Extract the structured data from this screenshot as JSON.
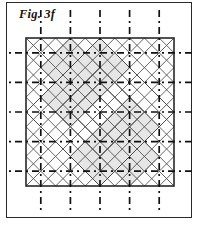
{
  "figure": {
    "caption": "Fig. 3f",
    "panel": {
      "x": 6,
      "y": 2,
      "width": 186,
      "height": 216,
      "border_color": "#2a2a2a",
      "background": "#ffffff"
    },
    "colors": {
      "frame_stroke": "#2a2a2a",
      "square_stroke": "#1a1a1a",
      "diagonal_stroke": "#555555",
      "grid_dash_stroke": "#111111",
      "shade_fill": "#e6e6e6",
      "shade_stroke": "#777777",
      "background": "#ffffff"
    },
    "geometry": {
      "description": "Square boundary with an overlaid 45-degree diamond lattice and a dash-dot square grid extending past the square edges.",
      "square": {
        "x": 19,
        "y": 35,
        "size": 148
      },
      "grid": {
        "divisions": 5,
        "cell_size": 29.6,
        "vertical_line_x": [
          33.8,
          63.4,
          93.0,
          122.6,
          152.2
        ],
        "horizontal_line_y": [
          49.8,
          79.4,
          109.0,
          138.6,
          168.2
        ],
        "overhang": 28,
        "dash_pattern": "7,4,2,4",
        "stroke_width": 1.7
      },
      "diagonals": {
        "step": 29.6,
        "stroke_width": 0.9,
        "note": "Two families of 45-degree lines clipped to the square, forming nested diamonds."
      },
      "shaded_polygons": [
        [
          [
            93,
            35
          ],
          [
            122.6,
            64.6
          ],
          [
            93,
            94.2
          ],
          [
            63.4,
            64.6
          ]
        ],
        [
          [
            63.4,
            64.6
          ],
          [
            93,
            94.2
          ],
          [
            63.4,
            123.8
          ],
          [
            33.8,
            94.2
          ]
        ],
        [
          [
            122.6,
            94.2
          ],
          [
            152.2,
            123.8
          ],
          [
            122.6,
            153.4
          ],
          [
            93,
            123.8
          ]
        ],
        [
          [
            93,
            123.8
          ],
          [
            122.6,
            153.4
          ],
          [
            93,
            183.0
          ],
          [
            63.4,
            153.4
          ]
        ],
        [
          [
            63.4,
            35
          ],
          [
            93,
            64.6
          ],
          [
            63.4,
            94.2
          ],
          [
            33.8,
            64.6
          ]
        ],
        [
          [
            122.6,
            123.8
          ],
          [
            152.2,
            153.4
          ],
          [
            122.6,
            183.0
          ],
          [
            93,
            153.4
          ]
        ]
      ],
      "inner_diamonds": [
        {
          "cx": 93,
          "cy": 109,
          "r": 74
        },
        {
          "cx": 93,
          "cy": 109,
          "r": 44.4
        },
        {
          "cx": 93,
          "cy": 109,
          "r": 29.6
        },
        {
          "cx": 93,
          "cy": 109,
          "r": 14.8
        }
      ]
    }
  }
}
